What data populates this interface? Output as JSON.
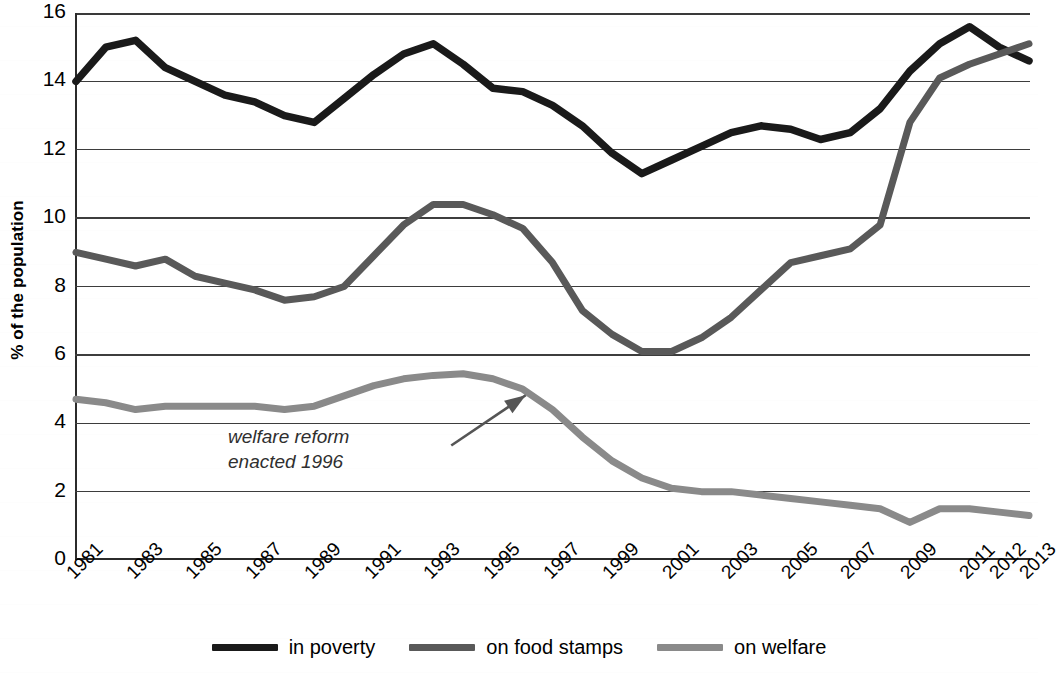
{
  "chart_data": {
    "type": "line",
    "title": "",
    "xlabel": "",
    "ylabel": "% of the population",
    "ylim": [
      0,
      16
    ],
    "ytick_values": [
      0,
      2,
      4,
      6,
      8,
      10,
      12,
      14,
      16
    ],
    "ytick_labels": [
      "0",
      "2",
      "4",
      "6",
      "8",
      "10",
      "12",
      "14",
      "16"
    ],
    "grid": true,
    "legend_position": "bottom-center",
    "x": [
      1981,
      1982,
      1983,
      1984,
      1985,
      1986,
      1987,
      1988,
      1989,
      1990,
      1991,
      1992,
      1993,
      1994,
      1995,
      1996,
      1997,
      1998,
      1999,
      2000,
      2001,
      2002,
      2003,
      2004,
      2005,
      2006,
      2007,
      2008,
      2009,
      2010,
      2011,
      2012,
      2013
    ],
    "xtick_labels": [
      "1981",
      "1983",
      "1985",
      "1987",
      "1989",
      "1991",
      "1993",
      "1995",
      "1997",
      "1999",
      "2001",
      "2003",
      "2005",
      "2007",
      "2009",
      "2011",
      "2012",
      "2013"
    ],
    "xtick_years": [
      1981,
      1983,
      1985,
      1987,
      1989,
      1991,
      1993,
      1995,
      1997,
      1999,
      2001,
      2003,
      2005,
      2007,
      2009,
      2011,
      2012,
      2013
    ],
    "series": [
      {
        "name": "in poverty",
        "color": "#1a1a1a",
        "width": 7.5,
        "values": [
          14.0,
          15.0,
          15.2,
          14.4,
          14.0,
          13.6,
          13.4,
          13.0,
          12.8,
          13.5,
          14.2,
          14.8,
          15.1,
          14.5,
          13.8,
          13.7,
          13.3,
          12.7,
          11.9,
          11.3,
          11.7,
          12.1,
          12.5,
          12.7,
          12.6,
          12.3,
          12.5,
          13.2,
          14.3,
          15.1,
          15.6,
          15.0,
          14.6
        ]
      },
      {
        "name": "on food stamps",
        "color": "#595959",
        "width": 7.0,
        "values": [
          9.0,
          8.8,
          8.6,
          8.8,
          8.3,
          8.1,
          7.9,
          7.6,
          7.7,
          8.0,
          8.9,
          9.8,
          10.4,
          10.4,
          10.1,
          9.7,
          8.7,
          7.3,
          6.6,
          6.1,
          6.1,
          6.5,
          7.1,
          7.9,
          8.7,
          8.9,
          9.1,
          9.8,
          12.8,
          14.1,
          14.5,
          14.8,
          15.1
        ]
      },
      {
        "name": "on welfare",
        "color": "#8a8a8a",
        "width": 7.0,
        "values": [
          4.7,
          4.6,
          4.4,
          4.5,
          4.5,
          4.5,
          4.5,
          4.4,
          4.5,
          4.8,
          5.1,
          5.3,
          5.4,
          5.45,
          5.3,
          5.0,
          4.4,
          3.6,
          2.9,
          2.4,
          2.1,
          2.0,
          2.0,
          1.9,
          1.8,
          1.7,
          1.6,
          1.5,
          1.1,
          1.5,
          1.5,
          1.4,
          1.3
        ]
      }
    ],
    "annotations": [
      {
        "text": "welfare reform\nenacted 1996",
        "style": "italic",
        "arrow": true,
        "arrow_from_year": 1993.6,
        "arrow_from_value": 3.35,
        "arrow_to_year": 1996.1,
        "arrow_to_value": 4.82
      }
    ]
  },
  "legend": {
    "items": [
      {
        "label": "in poverty",
        "color": "#1a1a1a"
      },
      {
        "label": "on food stamps",
        "color": "#595959"
      },
      {
        "label": "on welfare",
        "color": "#8a8a8a"
      }
    ]
  },
  "annotation_text": {
    "line1": "welfare reform",
    "line2": "enacted 1996"
  }
}
